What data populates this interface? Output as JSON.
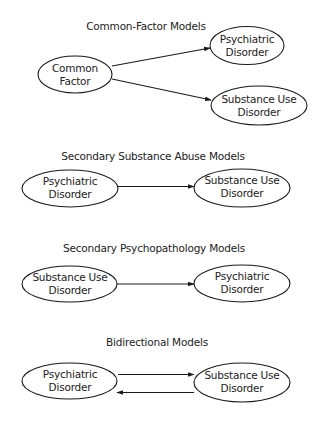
{
  "diagram": {
    "models": [
      {
        "title": "Common-Factor Models",
        "nodes": [
          {
            "id": "cf",
            "line1": "Common",
            "line2": "Factor"
          },
          {
            "id": "pd",
            "line1": "Psychiatric",
            "line2": "Disorder"
          },
          {
            "id": "sud",
            "line1": "Substance Use",
            "line2": "Disorder"
          }
        ],
        "edges": [
          {
            "from": "cf",
            "to": "pd"
          },
          {
            "from": "cf",
            "to": "sud"
          }
        ]
      },
      {
        "title": "Secondary Substance Abuse Models",
        "nodes": [
          {
            "id": "pd",
            "line1": "Psychiatric",
            "line2": "Disorder"
          },
          {
            "id": "sud",
            "line1": "Substance Use",
            "line2": "Disorder"
          }
        ],
        "edges": [
          {
            "from": "pd",
            "to": "sud"
          }
        ]
      },
      {
        "title": "Secondary Psychopathology Models",
        "nodes": [
          {
            "id": "sud",
            "line1": "Substance Use",
            "line2": "Disorder"
          },
          {
            "id": "pd",
            "line1": "Psychiatric",
            "line2": "Disorder"
          }
        ],
        "edges": [
          {
            "from": "sud",
            "to": "pd"
          }
        ]
      },
      {
        "title": "Bidirectional Models",
        "nodes": [
          {
            "id": "pd",
            "line1": "Psychiatric",
            "line2": "Disorder"
          },
          {
            "id": "sud",
            "line1": "Substance Use",
            "line2": "Disorder"
          }
        ],
        "edges": [
          {
            "from": "pd",
            "to": "sud"
          },
          {
            "from": "sud",
            "to": "pd"
          }
        ]
      }
    ]
  }
}
